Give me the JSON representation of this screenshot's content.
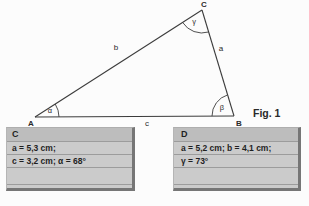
{
  "figure": {
    "caption": "Fig. 1",
    "vertex_labels": {
      "A": "A",
      "B": "B",
      "C": "C"
    },
    "side_labels": {
      "a": "a",
      "b": "b",
      "c": "c"
    },
    "angle_labels": {
      "alpha": "α",
      "beta": "β",
      "gamma": "γ"
    }
  },
  "cards": [
    {
      "title": "C",
      "lines": [
        "a = 5,3 cm;",
        "c = 3,2 cm; α = 68°",
        ""
      ]
    },
    {
      "title": "D",
      "lines": [
        "a = 5,2 cm; b = 4,1 cm;",
        "γ = 73°",
        ""
      ]
    }
  ],
  "colors": {
    "background": "#fcfcfc",
    "line": "#3c3c3c",
    "card_body": "#cbcbcb",
    "card_header": "#bdbdbd",
    "card_rule": "#9c9c9c",
    "card_shadow": "#767676",
    "text": "#2a2a2a"
  }
}
